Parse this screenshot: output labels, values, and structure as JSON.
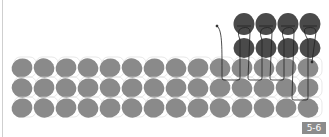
{
  "figure": {
    "label": "5-6"
  },
  "colors": {
    "base_bead": "#8a8a8a",
    "added_bead": "#4a4a4a",
    "thread": "#222222",
    "bead_outline": "#d8d8d8",
    "label_bg": "#8c8c8c"
  },
  "base_rows": {
    "rows": 3,
    "columns": 14,
    "row_centers_y": [
      68,
      88,
      108
    ],
    "first_col_x": 22,
    "col_pitch": 22
  },
  "added_beads": {
    "rows": 2,
    "columns": 4,
    "row_centers_y": [
      24,
      48
    ],
    "col_centers_x": [
      244,
      266,
      288,
      310
    ]
  }
}
